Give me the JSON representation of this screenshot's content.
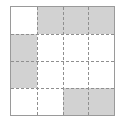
{
  "figure": {
    "name": "shaded-grid-diagram",
    "rows": 4,
    "columns": 4,
    "colors": {
      "shaded": "#d2d2d2",
      "empty": "#ffffff",
      "border": "#9a9a9a",
      "gridline": "#8f8f8f"
    },
    "gridline_style": "dashed",
    "cells": [
      [
        {
          "row": 1,
          "col": 1,
          "state": "empty"
        },
        {
          "row": 1,
          "col": 2,
          "state": "shaded"
        },
        {
          "row": 1,
          "col": 3,
          "state": "shaded"
        },
        {
          "row": 1,
          "col": 4,
          "state": "shaded"
        }
      ],
      [
        {
          "row": 2,
          "col": 1,
          "state": "shaded"
        },
        {
          "row": 2,
          "col": 2,
          "state": "empty"
        },
        {
          "row": 2,
          "col": 3,
          "state": "empty"
        },
        {
          "row": 2,
          "col": 4,
          "state": "empty"
        }
      ],
      [
        {
          "row": 3,
          "col": 1,
          "state": "shaded"
        },
        {
          "row": 3,
          "col": 2,
          "state": "empty"
        },
        {
          "row": 3,
          "col": 3,
          "state": "empty"
        },
        {
          "row": 3,
          "col": 4,
          "state": "empty"
        }
      ],
      [
        {
          "row": 4,
          "col": 1,
          "state": "empty"
        },
        {
          "row": 4,
          "col": 2,
          "state": "empty"
        },
        {
          "row": 4,
          "col": 3,
          "state": "shaded"
        },
        {
          "row": 4,
          "col": 4,
          "state": "shaded"
        }
      ]
    ],
    "shaded_count": 7,
    "empty_count": 9
  }
}
